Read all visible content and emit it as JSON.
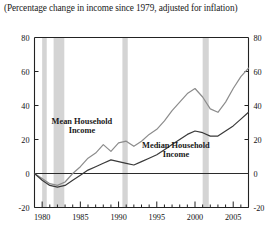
{
  "caption": "(Percentage change in income since 1979, adjusted for inflation)",
  "chart_data": {
    "type": "line",
    "title": "(Percentage change in income since 1979, adjusted for inflation)",
    "xlabel": "",
    "ylabel": "",
    "xlim": [
      1979,
      2007
    ],
    "ylim": [
      -20,
      80
    ],
    "grid": false,
    "legend": "inline-annotations",
    "yticks": [
      "80",
      "60",
      "40",
      "20",
      "0",
      "-20"
    ],
    "ytick_values": [
      80,
      60,
      40,
      20,
      0,
      -20
    ],
    "right_axis_labels": [
      "80",
      "60",
      "40",
      "20",
      "0",
      "-20"
    ],
    "xticks": [
      "1980",
      "1985",
      "1990",
      "1995",
      "2000",
      "2005"
    ],
    "xtick_values": [
      1980,
      1985,
      1990,
      1995,
      2000,
      2005
    ],
    "minor_xticks_every": 1,
    "zero_line": 0,
    "shaded_bands": [
      {
        "name": "recession-1980",
        "start": 1980.0,
        "end": 1980.6
      },
      {
        "name": "recession-1981-82",
        "start": 1981.5,
        "end": 1982.9
      },
      {
        "name": "recession-1990-91",
        "start": 1990.5,
        "end": 1991.2
      },
      {
        "name": "recession-2001",
        "start": 2001.0,
        "end": 2001.8
      }
    ],
    "x": [
      1979,
      1980,
      1981,
      1982,
      1983,
      1984,
      1985,
      1986,
      1987,
      1988,
      1989,
      1990,
      1991,
      1992,
      1993,
      1994,
      1995,
      1996,
      1997,
      1998,
      1999,
      2000,
      2001,
      2002,
      2003,
      2004,
      2005,
      2006,
      2007
    ],
    "series": [
      {
        "name": "Mean Household Income",
        "color": "#8c8c8c",
        "values": [
          0,
          -3,
          -6,
          -7,
          -5,
          0,
          4,
          9,
          12,
          17,
          13,
          18,
          19,
          16,
          19,
          23,
          26,
          31,
          37,
          42,
          47,
          50,
          45,
          38,
          36,
          42,
          50,
          57,
          62
        ]
      },
      {
        "name": "Median Household Income",
        "color": "#3a3a3a",
        "values": [
          0,
          -4,
          -7,
          -8,
          -7,
          -4,
          -1,
          2,
          4,
          6,
          8,
          7,
          6,
          5,
          7,
          9,
          11,
          14,
          17,
          20,
          23,
          25,
          24,
          22,
          22,
          25,
          28,
          32,
          36
        ]
      }
    ],
    "annotations": [
      {
        "name": "mean-label",
        "text_line1": "Mean Household",
        "text_line2": "Income",
        "x": 1985.2,
        "y": 29
      },
      {
        "name": "median-label",
        "text_line1": "Median Household",
        "text_line2": "Income",
        "x": 1997.5,
        "y": 15
      }
    ]
  },
  "colors": {
    "mean_line": "#8c8c8c",
    "median_line": "#3a3a3a",
    "band": "#d4d4d4",
    "axis": "#222222",
    "background": "#ffffff"
  }
}
